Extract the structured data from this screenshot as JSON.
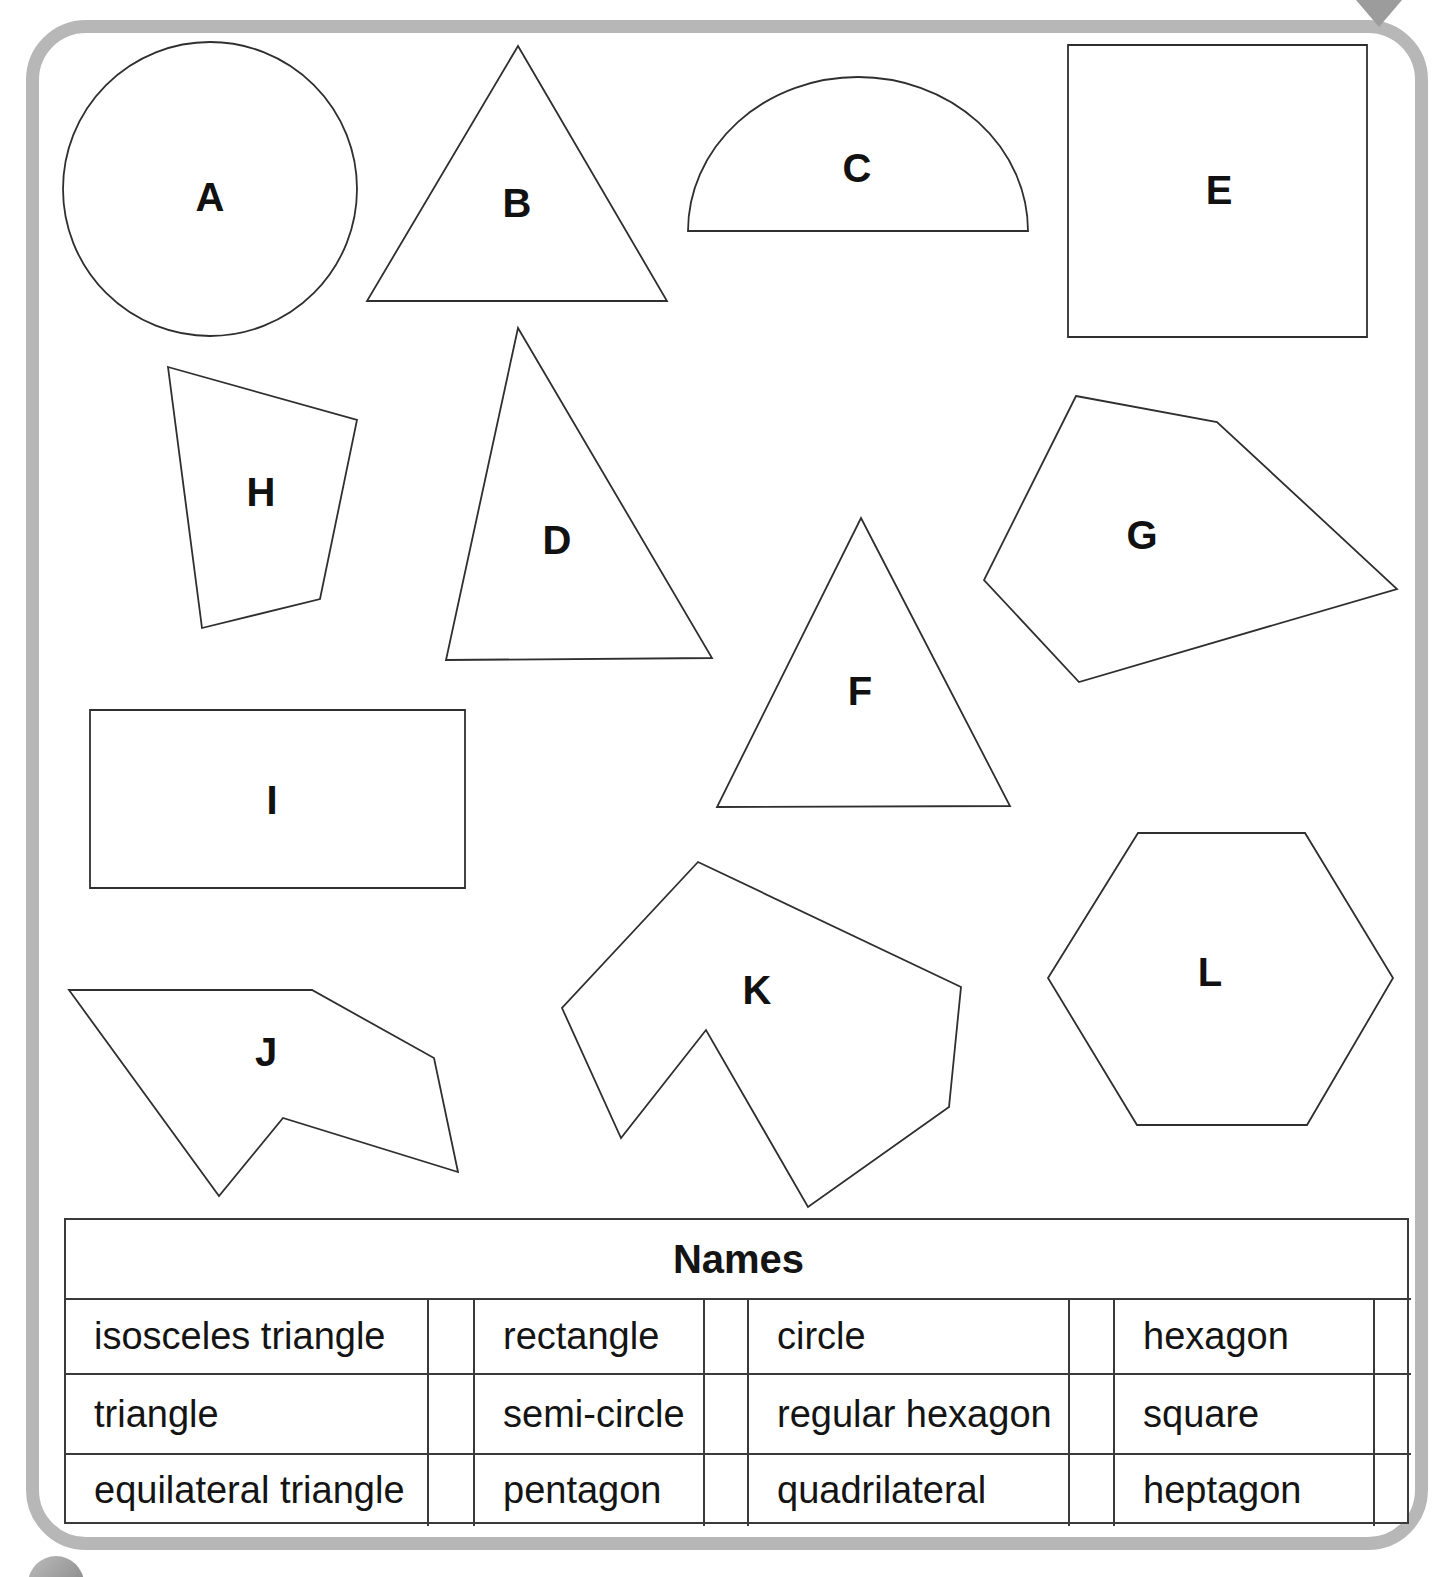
{
  "page": {
    "background": "#ffffff",
    "border_color": "#b7b7b7",
    "outline_color": "#2f2f2f",
    "table_border_color": "#3a3a3a",
    "corner_arrow_color": "#9c9c9c",
    "bubble_color": "#9e9e9e"
  },
  "shapes": [
    {
      "label": "A",
      "kind": "circle",
      "cx": 210,
      "cy": 189,
      "r": 147,
      "label_x": 210,
      "label_y": 197
    },
    {
      "label": "B",
      "kind": "polygon",
      "points": "518,46 667,301 367,301",
      "label_x": 517,
      "label_y": 203
    },
    {
      "label": "C",
      "kind": "path",
      "d": "M 688 231 A 170 154 0 0 1 1028 231 Z",
      "label_x": 857,
      "label_y": 168
    },
    {
      "label": "E",
      "kind": "polygon",
      "points": "1068,45 1367,45 1367,337 1068,337",
      "label_x": 1219,
      "label_y": 190
    },
    {
      "label": "H",
      "kind": "polygon",
      "points": "168,367 357,420 320,599 202,628",
      "label_x": 261,
      "label_y": 492
    },
    {
      "label": "D",
      "kind": "polygon",
      "points": "518,328 712,658 446,660",
      "label_x": 557,
      "label_y": 540
    },
    {
      "label": "F",
      "kind": "polygon",
      "points": "861,518 1010,806 717,807",
      "label_x": 860,
      "label_y": 691
    },
    {
      "label": "G",
      "kind": "polygon",
      "points": "1076,396 1217,422 1397,589 1079,682 984,580",
      "label_x": 1142,
      "label_y": 535
    },
    {
      "label": "I",
      "kind": "polygon",
      "points": "90,710 465,710 465,888 90,888",
      "label_x": 272,
      "label_y": 800
    },
    {
      "label": "J",
      "kind": "polygon",
      "points": "69,990 312,990 434,1058 458,1172 283,1118 219,1196",
      "label_x": 266,
      "label_y": 1052
    },
    {
      "label": "K",
      "kind": "polygon",
      "points": "698,862 961,987 949,1107 808,1207 706,1030 621,1138 562,1008",
      "label_x": 757,
      "label_y": 990
    },
    {
      "label": "L",
      "kind": "polygon",
      "points": "1138,833 1305,833 1393,978 1307,1125 1137,1125 1048,978",
      "label_x": 1210,
      "label_y": 972
    }
  ],
  "names_table": {
    "title": "Names",
    "cells": [
      [
        "isosceles triangle",
        "rectangle",
        "circle",
        "hexagon"
      ],
      [
        "triangle",
        "semi-circle",
        "regular hexagon",
        "square"
      ],
      [
        "equilateral triangle",
        "pentagon",
        "quadrilateral",
        "heptagon"
      ]
    ]
  }
}
